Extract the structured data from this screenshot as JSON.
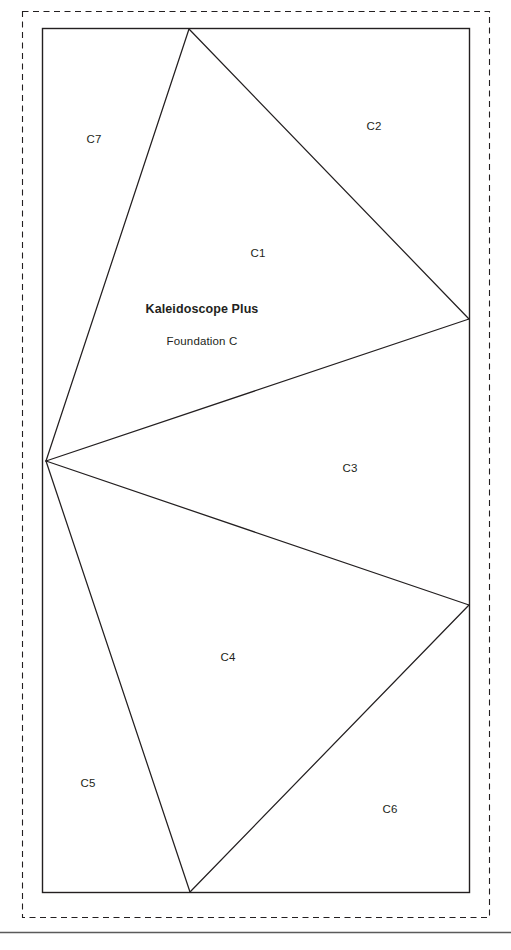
{
  "document": {
    "title_main": "Kaleidoscope Plus",
    "title_sub": "Foundation C",
    "ink_color": "#231f20",
    "paper_color": "#ffffff"
  },
  "pattern": {
    "block_label": "Foundation C pattern block",
    "seam_allowance_label": "seam allowance dashed border",
    "page_rule_label": "page separator rule",
    "sections": [
      {
        "id": "C1",
        "label": "C1",
        "x": 258,
        "y": 254
      },
      {
        "id": "C2",
        "label": "C2",
        "x": 374,
        "y": 127
      },
      {
        "id": "C3",
        "label": "C3",
        "x": 350,
        "y": 469
      },
      {
        "id": "C4",
        "label": "C4",
        "x": 228,
        "y": 658
      },
      {
        "id": "C5",
        "label": "C5",
        "x": 88,
        "y": 784
      },
      {
        "id": "C6",
        "label": "C6",
        "x": 390,
        "y": 810
      },
      {
        "id": "C7",
        "label": "C7",
        "x": 94,
        "y": 140
      }
    ],
    "title_position": {
      "x": 202,
      "y": 324
    },
    "geometry": {
      "seam_rect": {
        "x": 22,
        "y": 11,
        "width": 468,
        "height": 907
      },
      "block_rect": {
        "x": 42,
        "y": 28,
        "width": 428,
        "height": 865
      },
      "hub": {
        "x": 46,
        "y": 461
      },
      "apex_top": {
        "x": 189,
        "y": 29
      },
      "right_upper": {
        "x": 469,
        "y": 319
      },
      "right_lower": {
        "x": 469,
        "y": 605
      },
      "bottom": {
        "x": 190,
        "y": 892
      },
      "page_rule_y": 932
    }
  }
}
